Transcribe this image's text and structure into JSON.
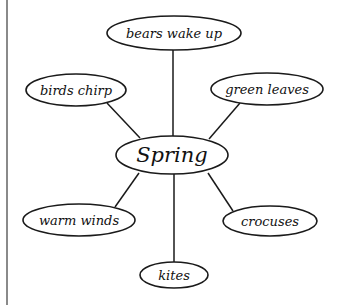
{
  "diagram": {
    "type": "concept-web",
    "center": {
      "label": "Spring",
      "cx": 172,
      "cy": 155,
      "rx": 56,
      "ry": 19
    },
    "nodes": [
      {
        "id": "bears",
        "label": "bears wake up",
        "cx": 174,
        "cy": 33,
        "rx": 67,
        "ry": 17
      },
      {
        "id": "birds",
        "label": "birds chirp",
        "cx": 76,
        "cy": 90,
        "rx": 50,
        "ry": 16
      },
      {
        "id": "leaves",
        "label": "green leaves",
        "cx": 267,
        "cy": 89,
        "rx": 56,
        "ry": 16
      },
      {
        "id": "winds",
        "label": "warm winds",
        "cx": 79,
        "cy": 220,
        "rx": 56,
        "ry": 16
      },
      {
        "id": "crocuses",
        "label": "crocuses",
        "cx": 270,
        "cy": 221,
        "rx": 47,
        "ry": 15
      },
      {
        "id": "kites",
        "label": "kites",
        "cx": 174,
        "cy": 275,
        "rx": 34,
        "ry": 13
      }
    ],
    "edges": [
      {
        "from": "center",
        "to": "bears",
        "x1": 173,
        "y1": 136,
        "x2": 173,
        "y2": 50
      },
      {
        "from": "center",
        "to": "birds",
        "x1": 140,
        "y1": 138,
        "x2": 107,
        "y2": 103
      },
      {
        "from": "center",
        "to": "leaves",
        "x1": 209,
        "y1": 139,
        "x2": 240,
        "y2": 103
      },
      {
        "from": "center",
        "to": "winds",
        "x1": 139,
        "y1": 173,
        "x2": 115,
        "y2": 207
      },
      {
        "from": "center",
        "to": "kites",
        "x1": 174,
        "y1": 174,
        "x2": 174,
        "y2": 262
      },
      {
        "from": "center",
        "to": "crocuses",
        "x1": 208,
        "y1": 173,
        "x2": 233,
        "y2": 211
      }
    ],
    "colors": {
      "stroke": "#1a1a1a",
      "background": "#ffffff",
      "left_rule": "#8a8a8a"
    }
  }
}
